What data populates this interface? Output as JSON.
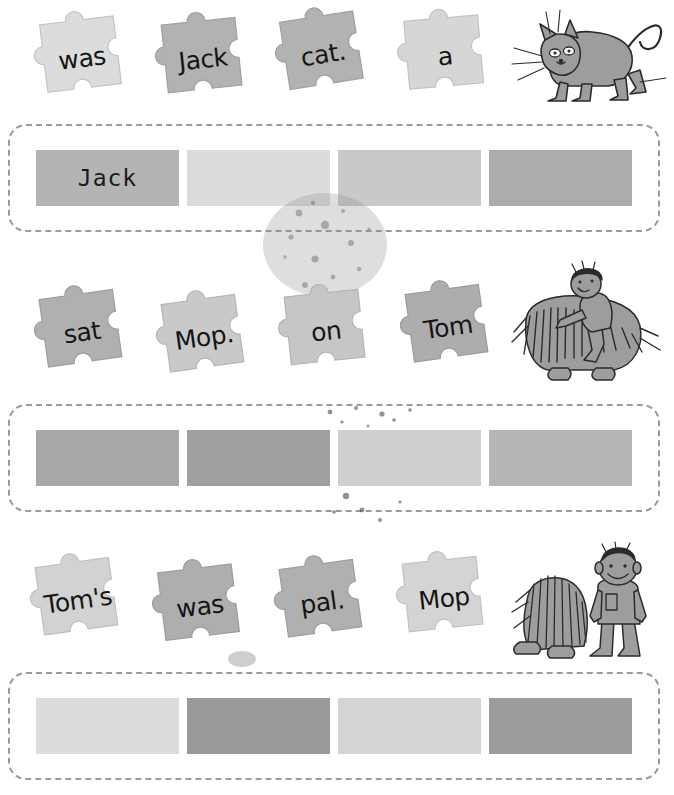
{
  "worksheet": {
    "type": "sentence-building-puzzle-worksheet",
    "background_color": "#ffffff"
  },
  "palette": {
    "piece_light": "#dcdcdc",
    "piece_medium": "#b0b0b0",
    "piece_dark": "#9a9a9a",
    "piece_outline": "#c3c3c3",
    "slot_light": "#dadada",
    "slot_medium": "#b4b4b4",
    "slot_dark": "#8f8f8f",
    "dash_border": "#9a9a9a",
    "ink": "#151515",
    "illustration_fill": "#9d9d9d",
    "illustration_line": "#2b2b2b"
  },
  "rows": [
    {
      "id": "row-1",
      "pieces": [
        {
          "word": "was",
          "shade": "#dcdcdc",
          "rotation": -7,
          "left": 34,
          "top": 14
        },
        {
          "word": "Jack",
          "shade": "#b2b2b2",
          "rotation": -6,
          "left": 155,
          "top": 15
        },
        {
          "word": "cat.",
          "shade": "#b2b2b2",
          "rotation": -9,
          "left": 275,
          "top": 10
        },
        {
          "word": "a",
          "shade": "#d6d6d6",
          "rotation": -5,
          "left": 397,
          "top": 12
        }
      ],
      "illustration": {
        "name": "cat-illustration",
        "alt": "gray cartoon cat crouching with curved tail and whiskers",
        "left": 508,
        "top": 4,
        "width": 160,
        "height": 110
      },
      "answer_strip": {
        "id": "answer-strip-1",
        "top": 124,
        "slots": [
          {
            "value": "Jack",
            "shade": "#b4b4b4",
            "filled": true
          },
          {
            "value": "",
            "shade": "#dcdcdc",
            "filled": false
          },
          {
            "value": "",
            "shade": "#c9c9c9",
            "filled": false
          },
          {
            "value": "",
            "shade": "#acacac",
            "filled": false
          }
        ]
      }
    },
    {
      "id": "row-2",
      "pieces": [
        {
          "word": "sat",
          "shade": "#b0b0b0",
          "rotation": -8,
          "left": 34,
          "top": 288
        },
        {
          "word": "Mop.",
          "shade": "#c9c9c9",
          "rotation": -8,
          "left": 156,
          "top": 293
        },
        {
          "word": "on",
          "shade": "#c6c6c6",
          "rotation": -6,
          "left": 278,
          "top": 287
        },
        {
          "word": "Tom",
          "shade": "#adadad",
          "rotation": -8,
          "left": 400,
          "top": 283
        }
      ],
      "illustration": {
        "name": "boy-riding-dog-illustration",
        "alt": "boy sitting on a large shaggy dog",
        "left": 510,
        "top": 258,
        "width": 155,
        "height": 128
      },
      "answer_strip": {
        "id": "answer-strip-2",
        "top": 404,
        "slots": [
          {
            "value": "",
            "shade": "#a8a8a8",
            "filled": false
          },
          {
            "value": "",
            "shade": "#a0a0a0",
            "filled": false
          },
          {
            "value": "",
            "shade": "#cfcfcf",
            "filled": false
          },
          {
            "value": "",
            "shade": "#b6b6b6",
            "filled": false
          }
        ]
      }
    },
    {
      "id": "row-3",
      "pieces": [
        {
          "word": "Tom's",
          "shade": "#d2d2d2",
          "rotation": -8,
          "left": 30,
          "top": 556
        },
        {
          "word": "was",
          "shade": "#aeaeae",
          "rotation": -7,
          "left": 152,
          "top": 562
        },
        {
          "word": "pal.",
          "shade": "#b0b0b0",
          "rotation": -8,
          "left": 274,
          "top": 558
        },
        {
          "word": "Mop",
          "shade": "#d4d4d4",
          "rotation": -6,
          "left": 396,
          "top": 554
        }
      ],
      "illustration": {
        "name": "dog-and-boy-illustration",
        "alt": "shaggy dog sitting beside a smiling boy",
        "left": 506,
        "top": 546,
        "width": 160,
        "height": 118
      },
      "answer_strip": {
        "id": "answer-strip-3",
        "top": 672,
        "slots": [
          {
            "value": "",
            "shade": "#dcdcdc",
            "filled": false
          },
          {
            "value": "",
            "shade": "#9a9a9a",
            "filled": false
          },
          {
            "value": "",
            "shade": "#d4d4d4",
            "filled": false
          },
          {
            "value": "",
            "shade": "#9c9c9c",
            "filled": false
          }
        ]
      }
    }
  ],
  "sentences": {
    "row_1_answer": "Jack was a cat.",
    "row_2_answer": "Tom sat on Mop.",
    "row_3_answer": "Mop was Tom's pal."
  }
}
